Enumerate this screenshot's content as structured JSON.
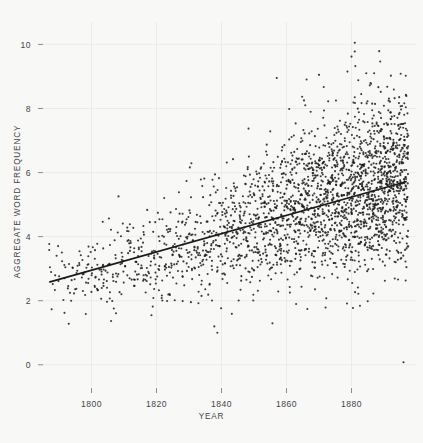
{
  "chart_data": {
    "type": "scatter",
    "title": "",
    "xlabel": "YEAR",
    "ylabel": "AGGREGATE WORD FREQUENCY",
    "xlim": [
      1786,
      1898
    ],
    "ylim": [
      -0.35,
      10.45
    ],
    "xticks": [
      1800,
      1820,
      1840,
      1860,
      1880
    ],
    "xtick_labels": [
      "1800",
      "1820",
      "1840",
      "1860",
      "1880"
    ],
    "yticks": [
      0,
      2,
      4,
      6,
      8,
      10
    ],
    "ytick_labels": [
      "0",
      "2",
      "4",
      "6",
      "8",
      "10"
    ],
    "grid": true,
    "grid_color": "#ebebe8",
    "legend": "none",
    "point_color": "#1d1d1d",
    "point_size": 1.05,
    "background_color": "#f8f8f6",
    "n_points": 2850,
    "series": [
      {
        "name": "aggregate word frequency",
        "kind": "scatter",
        "description": "One point per book: aggregate word frequency plotted against year of publication. Spread widens and density increases strongly after 1850.",
        "x_range": [
          1787,
          1897
        ],
        "y_range": [
          0.05,
          10.1
        ],
        "density_profile": [
          {
            "year": 1790,
            "count": 14,
            "mean": 2.7,
            "sd": 0.52
          },
          {
            "year": 1795,
            "count": 22,
            "mean": 2.74,
            "sd": 0.55
          },
          {
            "year": 1800,
            "count": 30,
            "mean": 2.82,
            "sd": 0.58
          },
          {
            "year": 1805,
            "count": 32,
            "mean": 2.92,
            "sd": 0.6
          },
          {
            "year": 1810,
            "count": 34,
            "mean": 3.02,
            "sd": 0.62
          },
          {
            "year": 1815,
            "count": 38,
            "mean": 3.15,
            "sd": 0.66
          },
          {
            "year": 1820,
            "count": 42,
            "mean": 3.28,
            "sd": 0.7
          },
          {
            "year": 1825,
            "count": 48,
            "mean": 3.42,
            "sd": 0.74
          },
          {
            "year": 1830,
            "count": 54,
            "mean": 3.58,
            "sd": 0.78
          },
          {
            "year": 1835,
            "count": 62,
            "mean": 3.76,
            "sd": 0.84
          },
          {
            "year": 1840,
            "count": 72,
            "mean": 3.94,
            "sd": 0.9
          },
          {
            "year": 1845,
            "count": 84,
            "mean": 4.12,
            "sd": 0.96
          },
          {
            "year": 1850,
            "count": 98,
            "mean": 4.32,
            "sd": 1.02
          },
          {
            "year": 1855,
            "count": 114,
            "mean": 4.52,
            "sd": 1.08
          },
          {
            "year": 1860,
            "count": 132,
            "mean": 4.72,
            "sd": 1.14
          },
          {
            "year": 1865,
            "count": 150,
            "mean": 4.9,
            "sd": 1.18
          },
          {
            "year": 1870,
            "count": 168,
            "mean": 5.08,
            "sd": 1.22
          },
          {
            "year": 1875,
            "count": 186,
            "mean": 5.24,
            "sd": 1.24
          },
          {
            "year": 1880,
            "count": 206,
            "mean": 5.38,
            "sd": 1.26
          },
          {
            "year": 1885,
            "count": 224,
            "mean": 5.5,
            "sd": 1.26
          },
          {
            "year": 1890,
            "count": 240,
            "mean": 5.6,
            "sd": 1.25
          },
          {
            "year": 1895,
            "count": 236,
            "mean": 5.68,
            "sd": 1.24
          }
        ]
      },
      {
        "name": "linear fit",
        "kind": "line",
        "color": "#1a1a1a",
        "width": 1.7,
        "x0": 1787,
        "y0": 2.58,
        "x1": 1897,
        "y1": 5.72,
        "slope_per_year": 0.02855,
        "intercept_at_1787": 2.58
      }
    ],
    "notable_outliers": [
      {
        "year": 1881,
        "value": 10.05
      },
      {
        "year": 1881,
        "value": 9.78
      },
      {
        "year": 1880,
        "value": 9.62
      },
      {
        "year": 1870,
        "value": 9.05
      },
      {
        "year": 1857,
        "value": 8.95
      },
      {
        "year": 1891,
        "value": 8.68
      },
      {
        "year": 1889,
        "value": 8.52
      },
      {
        "year": 1896,
        "value": 0.08
      },
      {
        "year": 1793,
        "value": 1.28
      }
    ]
  }
}
